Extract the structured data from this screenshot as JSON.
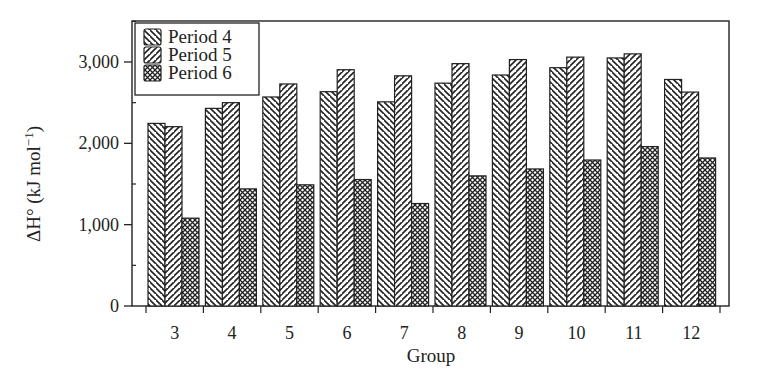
{
  "chart_data": {
    "type": "bar",
    "title": "",
    "xlabel": "Group",
    "ylabel": "ΔH° (kJ mol⁻¹)",
    "ylabel_parts": {
      "main": "ΔH° (kJ mol",
      "sup": "−1",
      "close": ")"
    },
    "ylim": [
      0,
      3500
    ],
    "yticks": [
      0,
      1000,
      2000,
      3000
    ],
    "ytick_labels": [
      "0",
      "1,000",
      "2,000",
      "3,000"
    ],
    "yminor_ticks": [
      500,
      1500,
      2500,
      3500
    ],
    "grid": false,
    "legend_position": "upper left",
    "categories": [
      "3",
      "4",
      "5",
      "6",
      "7",
      "8",
      "9",
      "10",
      "11",
      "12"
    ],
    "series": [
      {
        "name": "Period 4",
        "pattern": "hatch-backslash",
        "values": [
          2245,
          2430,
          2570,
          2635,
          2510,
          2740,
          2840,
          2930,
          3050,
          2785
        ]
      },
      {
        "name": "Period 5",
        "pattern": "hatch-slash",
        "values": [
          2205,
          2500,
          2730,
          2905,
          2830,
          2980,
          3030,
          3060,
          3100,
          2630
        ]
      },
      {
        "name": "Period 6",
        "pattern": "crosshatch",
        "values": [
          1080,
          1440,
          1490,
          1555,
          1260,
          1600,
          1685,
          1795,
          1960,
          1820
        ]
      }
    ],
    "colors": {
      "axis": "#222222",
      "bar_outline": "#222222",
      "hatch": "#222222",
      "background": "#ffffff"
    }
  }
}
